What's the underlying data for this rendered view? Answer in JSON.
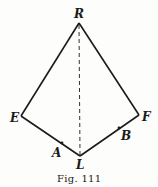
{
  "figure": {
    "caption": "Fig. 111",
    "vertices": {
      "R": "R",
      "E": "E",
      "F": "F",
      "L": "L"
    },
    "points": {
      "A": "A",
      "B": "B"
    },
    "edges": [
      {
        "from": "R",
        "to": "E",
        "style": "solid"
      },
      {
        "from": "R",
        "to": "F",
        "style": "solid"
      },
      {
        "from": "E",
        "to": "L",
        "style": "solid"
      },
      {
        "from": "F",
        "to": "L",
        "style": "solid"
      },
      {
        "from": "R",
        "to": "L",
        "style": "dashed"
      }
    ],
    "colors": {
      "ink": "#1a1a1a",
      "paper": "#fdfdfb"
    }
  }
}
